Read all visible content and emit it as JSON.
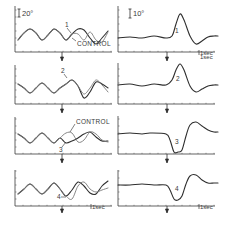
{
  "figure": {
    "ink_color": "#3a3a3a",
    "trace_color": "#2e2e2e",
    "trace_color_alt": "#7a7a7a",
    "background": "#ffffff"
  },
  "chart_data": [
    {
      "type": "line",
      "panel": "left-1",
      "scale_label": "20°",
      "time_label": "",
      "trace_label": "1",
      "annotation": "CONTROL",
      "series": [
        {
          "name": "1",
          "points": [
            [
              18,
              40
            ],
            [
              24,
              33
            ],
            [
              30,
              29
            ],
            [
              36,
              33
            ],
            [
              42,
              40
            ],
            [
              48,
              35
            ],
            [
              54,
              29
            ],
            [
              60,
              33
            ],
            [
              66,
              40
            ],
            [
              72,
              34
            ],
            [
              78,
              29
            ],
            [
              84,
              30
            ],
            [
              90,
              38
            ],
            [
              96,
              44
            ],
            [
              102,
              38
            ],
            [
              108,
              31
            ]
          ]
        },
        {
          "name": "CONTROL",
          "points": [
            [
              18,
              40
            ],
            [
              24,
              33
            ],
            [
              30,
              29
            ],
            [
              36,
              33
            ],
            [
              42,
              40
            ],
            [
              48,
              35
            ],
            [
              54,
              29
            ],
            [
              60,
              33
            ],
            [
              66,
              40
            ],
            [
              72,
              34
            ],
            [
              78,
              34
            ],
            [
              84,
              40
            ],
            [
              90,
              32
            ],
            [
              96,
              40
            ],
            [
              102,
              42
            ],
            [
              108,
              32
            ]
          ]
        }
      ]
    },
    {
      "type": "line",
      "panel": "right-1",
      "scale_label": "10°",
      "time_label": "1sec",
      "trace_label": "1",
      "series": [
        {
          "name": "1",
          "points": [
            [
              118,
              38
            ],
            [
              130,
              37
            ],
            [
              142,
              38
            ],
            [
              154,
              36
            ],
            [
              166,
              38
            ],
            [
              172,
              36
            ],
            [
              176,
              24
            ],
            [
              180,
              14
            ],
            [
              184,
              20
            ],
            [
              190,
              36
            ],
            [
              196,
              44
            ],
            [
              202,
              41
            ],
            [
              208,
              37
            ],
            [
              214,
              36
            ],
            [
              218,
              36
            ]
          ]
        }
      ]
    },
    {
      "type": "line",
      "panel": "left-2",
      "trace_label": "2",
      "series": [
        {
          "name": "2",
          "points": [
            [
              18,
              84
            ],
            [
              24,
              88
            ],
            [
              30,
              93
            ],
            [
              36,
              88
            ],
            [
              42,
              83
            ],
            [
              48,
              88
            ],
            [
              54,
              93
            ],
            [
              60,
              88
            ],
            [
              66,
              84
            ],
            [
              72,
              80
            ],
            [
              78,
              86
            ],
            [
              84,
              98
            ],
            [
              90,
              92
            ],
            [
              96,
              82
            ],
            [
              102,
              84
            ],
            [
              108,
              88
            ]
          ]
        },
        {
          "name": "CONTROL",
          "points": [
            [
              18,
              84
            ],
            [
              24,
              88
            ],
            [
              30,
              93
            ],
            [
              36,
              88
            ],
            [
              42,
              83
            ],
            [
              48,
              88
            ],
            [
              54,
              93
            ],
            [
              60,
              88
            ],
            [
              66,
              84
            ],
            [
              72,
              80
            ],
            [
              78,
              86
            ],
            [
              84,
              94
            ],
            [
              90,
              88
            ],
            [
              96,
              80
            ],
            [
              102,
              85
            ],
            [
              108,
              92
            ]
          ]
        }
      ]
    },
    {
      "type": "line",
      "panel": "right-2",
      "time_label": "1sec",
      "trace_label": "2",
      "series": [
        {
          "name": "2",
          "points": [
            [
              118,
              85
            ],
            [
              130,
              84
            ],
            [
              142,
              86
            ],
            [
              154,
              84
            ],
            [
              166,
              85
            ],
            [
              172,
              80
            ],
            [
              176,
              70
            ],
            [
              180,
              64
            ],
            [
              184,
              70
            ],
            [
              190,
              86
            ],
            [
              196,
              92
            ],
            [
              202,
              89
            ],
            [
              208,
              86
            ],
            [
              214,
              85
            ],
            [
              218,
              85
            ]
          ]
        }
      ]
    },
    {
      "type": "line",
      "panel": "left-3",
      "trace_label": "3",
      "annotation": "CONTROL",
      "series": [
        {
          "name": "3",
          "points": [
            [
              18,
              134
            ],
            [
              24,
              138
            ],
            [
              30,
              143
            ],
            [
              36,
              138
            ],
            [
              42,
              133
            ],
            [
              48,
              138
            ],
            [
              54,
              143
            ],
            [
              60,
              138
            ],
            [
              66,
              143
            ],
            [
              72,
              141
            ],
            [
              78,
              138
            ],
            [
              84,
              134
            ],
            [
              90,
              132
            ],
            [
              96,
              137
            ],
            [
              102,
              141
            ],
            [
              108,
              141
            ]
          ]
        },
        {
          "name": "CONTROL",
          "points": [
            [
              18,
              134
            ],
            [
              24,
              138
            ],
            [
              30,
              143
            ],
            [
              36,
              138
            ],
            [
              42,
              133
            ],
            [
              48,
              138
            ],
            [
              54,
              143
            ],
            [
              60,
              138
            ],
            [
              66,
              133
            ],
            [
              72,
              133
            ],
            [
              78,
              142
            ],
            [
              84,
              140
            ],
            [
              90,
              132
            ],
            [
              96,
              134
            ],
            [
              102,
              140
            ],
            [
              108,
              142
            ]
          ]
        }
      ]
    },
    {
      "type": "line",
      "panel": "right-3",
      "trace_label": "3",
      "series": [
        {
          "name": "3",
          "points": [
            [
              118,
              134
            ],
            [
              130,
              133
            ],
            [
              142,
              134
            ],
            [
              150,
              133
            ],
            [
              166,
              134
            ],
            [
              170,
              140
            ],
            [
              174,
              152
            ],
            [
              178,
              152
            ],
            [
              182,
              150
            ],
            [
              186,
              136
            ],
            [
              190,
              125
            ],
            [
              196,
              122
            ],
            [
              202,
              126
            ],
            [
              208,
              130
            ],
            [
              214,
              132
            ],
            [
              218,
              132
            ]
          ]
        }
      ]
    },
    {
      "type": "line",
      "panel": "left-4",
      "trace_label": "4",
      "time_label": "1sec",
      "series": [
        {
          "name": "4",
          "points": [
            [
              18,
              194
            ],
            [
              24,
              189
            ],
            [
              30,
              184
            ],
            [
              36,
              189
            ],
            [
              42,
              194
            ],
            [
              48,
              189
            ],
            [
              54,
              183
            ],
            [
              60,
              189
            ],
            [
              66,
              196
            ],
            [
              72,
              190
            ],
            [
              78,
              182
            ],
            [
              84,
              186
            ],
            [
              90,
              193
            ],
            [
              96,
              194
            ],
            [
              102,
              186
            ],
            [
              108,
              181
            ]
          ]
        },
        {
          "name": "CONTROL",
          "points": [
            [
              18,
              194
            ],
            [
              24,
              189
            ],
            [
              30,
              184
            ],
            [
              36,
              189
            ],
            [
              42,
              194
            ],
            [
              48,
              189
            ],
            [
              54,
              183
            ],
            [
              60,
              189
            ],
            [
              66,
              196
            ],
            [
              72,
              199
            ],
            [
              78,
              186
            ],
            [
              84,
              182
            ],
            [
              90,
              189
            ],
            [
              96,
              192
            ],
            [
              102,
              190
            ],
            [
              108,
              188
            ]
          ]
        }
      ]
    },
    {
      "type": "line",
      "panel": "right-4",
      "trace_label": "4",
      "time_label": "1sec",
      "series": [
        {
          "name": "4",
          "points": [
            [
              118,
              185
            ],
            [
              130,
              185
            ],
            [
              142,
              184
            ],
            [
              154,
              185
            ],
            [
              166,
              185
            ],
            [
              170,
              190
            ],
            [
              174,
              199
            ],
            [
              178,
              200
            ],
            [
              182,
              196
            ],
            [
              186,
              184
            ],
            [
              190,
              176
            ],
            [
              196,
              175
            ],
            [
              202,
              180
            ],
            [
              208,
              183
            ],
            [
              214,
              183
            ],
            [
              218,
              183
            ]
          ]
        }
      ]
    }
  ],
  "labels": {
    "scale_left": "20°",
    "scale_right": "10°",
    "control_1": "CONTROL",
    "control_3": "CONTROL",
    "trace_1": "1",
    "trace_1r": "1",
    "trace_2": "2",
    "trace_2r": "2",
    "trace_3": "3",
    "trace_3r": "3",
    "trace_4": "4",
    "trace_4r": "4",
    "time_1r": "1sec",
    "time_2r": "1sec",
    "time_4l": "1sec",
    "time_4r": "1sec"
  }
}
